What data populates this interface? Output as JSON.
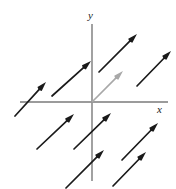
{
  "figure": {
    "kind": "vector-field-diagram",
    "title": "",
    "width": 176,
    "height": 189,
    "background": "#ffffff"
  },
  "axes": {
    "origin": {
      "x": 92,
      "y": 102
    },
    "color": "#7a7a7a",
    "stroke_width": 1.4,
    "x_axis": {
      "x1": 20,
      "y1": 102,
      "x2": 168,
      "y2": 102,
      "label": "x"
    },
    "y_axis": {
      "x1": 92,
      "y1": 24,
      "x2": 92,
      "y2": 181,
      "label": "y"
    },
    "x_label_position": {
      "x": 157,
      "y": 104
    },
    "y_label_position": {
      "x": 88,
      "y": 10
    }
  },
  "chart_data": {
    "type": "scatter",
    "title": "",
    "xlabel": "x",
    "ylabel": "y",
    "vectors": [
      {
        "name": "upper-left",
        "x1": 15,
        "y1": 116,
        "x2": 46,
        "y2": 82,
        "color": "#1a1a1a"
      },
      {
        "name": "upper-mid-left",
        "x1": 52,
        "y1": 96,
        "x2": 91,
        "y2": 61,
        "color": "#1a1a1a"
      },
      {
        "name": "upper-mid-right",
        "x1": 99,
        "y1": 72,
        "x2": 137,
        "y2": 34,
        "color": "#1a1a1a"
      },
      {
        "name": "upper-right",
        "x1": 137,
        "y1": 86,
        "x2": 171,
        "y2": 51,
        "color": "#1a1a1a"
      },
      {
        "name": "origin-highlight",
        "x1": 92,
        "y1": 102,
        "x2": 123,
        "y2": 71,
        "color": "#a8a8a8"
      },
      {
        "name": "lower-left",
        "x1": 37,
        "y1": 149,
        "x2": 74,
        "y2": 114,
        "color": "#1a1a1a"
      },
      {
        "name": "lower-mid-upper",
        "x1": 74,
        "y1": 149,
        "x2": 111,
        "y2": 113,
        "color": "#1a1a1a"
      },
      {
        "name": "lower-mid-lower",
        "x1": 66,
        "y1": 188,
        "x2": 104,
        "y2": 150,
        "color": "#1a1a1a"
      },
      {
        "name": "lower-right",
        "x1": 122,
        "y1": 160,
        "x2": 158,
        "y2": 123,
        "color": "#1a1a1a"
      },
      {
        "name": "far-lower-right",
        "x1": 113,
        "y1": 186,
        "x2": 146,
        "y2": 152,
        "color": "#1a1a1a"
      }
    ],
    "vector_color": "#1a1a1a",
    "highlight_vector_color": "#a8a8a8",
    "grid": false,
    "legend": null
  }
}
